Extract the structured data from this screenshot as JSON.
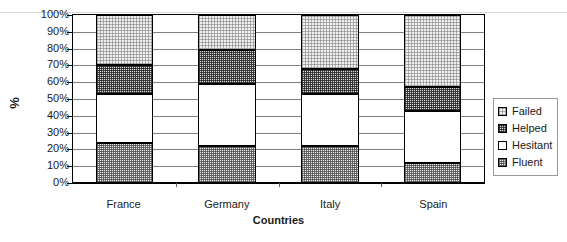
{
  "chart_data": {
    "type": "bar",
    "subtype": "stacked-100-percent",
    "title": "",
    "xlabel": "Countries",
    "ylabel": "%",
    "categories": [
      "France",
      "Germany",
      "Italy",
      "Spain"
    ],
    "ylim": [
      0,
      100
    ],
    "ytick_labels": [
      "0%",
      "10%",
      "20%",
      "30%",
      "40%",
      "50%",
      "60%",
      "70%",
      "80%",
      "90%",
      "100%"
    ],
    "ytick_values": [
      0,
      10,
      20,
      30,
      40,
      50,
      60,
      70,
      80,
      90,
      100
    ],
    "grid": true,
    "legend_position": "right",
    "stack_order_bottom_to_top": [
      "Fluent",
      "Hesitant",
      "Helped",
      "Failed"
    ],
    "series": [
      {
        "name": "Fluent",
        "values": [
          24,
          28,
          22,
          12
        ],
        "fill": "fluent"
      },
      {
        "name": "Hesitant",
        "values": [
          29,
          46,
          31,
          31
        ],
        "fill": "hesitant"
      },
      {
        "name": "Helped",
        "values": [
          17,
          26,
          15,
          14
        ],
        "fill": "helped"
      },
      {
        "name": "Failed",
        "values": [
          30,
          26,
          32,
          43
        ],
        "fill": "failed"
      }
    ],
    "cumulative_boundaries": {
      "France": [
        0,
        24,
        53,
        70,
        100
      ],
      "Germany": [
        0,
        28,
        74,
        100,
        100
      ],
      "Italy": [
        0,
        22,
        53,
        68,
        100
      ],
      "Spain": [
        0,
        12,
        43,
        57,
        100
      ]
    }
  },
  "legend": {
    "items": [
      {
        "label": "Failed",
        "fill": "failed"
      },
      {
        "label": "Helped",
        "fill": "helped"
      },
      {
        "label": "Hesitant",
        "fill": "hesitant"
      },
      {
        "label": "Fluent",
        "fill": "fluent"
      }
    ]
  },
  "colors": {
    "axis": "#000000",
    "grid": "#808080",
    "text": "#1a1a1a",
    "failed": "#f0f0f0",
    "helped": "#d9d9d9",
    "hesitant": "#ffffff",
    "fluent": "#e6e6e6"
  }
}
